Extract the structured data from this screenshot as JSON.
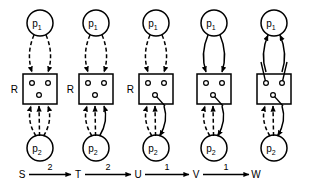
{
  "figure": {
    "type": "state-transition-diagram",
    "width": 316,
    "height": 193,
    "background_color": "#ffffff",
    "stroke_color": "#000000"
  },
  "labels": {
    "process_top": "p",
    "process_top_sub": "1",
    "process_bottom": "p",
    "process_bottom_sub": "2",
    "resource": "R"
  },
  "columns": [
    {
      "id": "S",
      "state_label": "S",
      "resource_label": "R",
      "top_label": "p",
      "top_sub": "1",
      "bottom_label": "p",
      "bottom_sub": "2",
      "cx": 40,
      "has_resource_label": true,
      "slot_links": [],
      "top_edges": [
        {
          "dir": "down",
          "style": "dashed"
        },
        {
          "dir": "down",
          "style": "dashed"
        }
      ],
      "bottom_edges": [
        {
          "dir": "up",
          "style": "dashed"
        },
        {
          "dir": "up",
          "style": "dashed"
        },
        {
          "dir": "up",
          "style": "dashed"
        }
      ]
    },
    {
      "id": "T",
      "state_label": "T",
      "resource_label": "R",
      "top_label": "p",
      "top_sub": "1",
      "bottom_label": "p",
      "bottom_sub": "2",
      "cx": 96,
      "has_resource_label": true,
      "slot_links": [],
      "top_edges": [
        {
          "dir": "down",
          "style": "dashed"
        },
        {
          "dir": "down",
          "style": "dashed"
        }
      ],
      "bottom_edges": [
        {
          "dir": "up",
          "style": "dashed"
        },
        {
          "dir": "up",
          "style": "dashed"
        },
        {
          "dir": "up",
          "style": "solid"
        }
      ]
    },
    {
      "id": "U",
      "state_label": "U",
      "resource_label": "R",
      "top_label": "p",
      "top_sub": "1",
      "bottom_label": "p",
      "bottom_sub": "2",
      "cx": 156,
      "has_resource_label": true,
      "slot_links": [
        "bottom"
      ],
      "top_edges": [
        {
          "dir": "down",
          "style": "dashed"
        },
        {
          "dir": "down",
          "style": "dashed"
        }
      ],
      "bottom_edges": [
        {
          "dir": "up",
          "style": "dashed"
        },
        {
          "dir": "up",
          "style": "dashed"
        },
        {
          "dir": "down",
          "style": "solid"
        }
      ]
    },
    {
      "id": "V",
      "state_label": "V",
      "resource_label": "",
      "top_label": "p",
      "top_sub": "1",
      "bottom_label": "p",
      "bottom_sub": "2",
      "cx": 214,
      "has_resource_label": false,
      "slot_links": [
        "bottom"
      ],
      "top_edges": [
        {
          "dir": "down",
          "style": "solid"
        },
        {
          "dir": "down",
          "style": "solid"
        }
      ],
      "bottom_edges": [
        {
          "dir": "up",
          "style": "dashed"
        },
        {
          "dir": "up",
          "style": "dashed"
        },
        {
          "dir": "down",
          "style": "solid"
        }
      ]
    },
    {
      "id": "W",
      "state_label": "W",
      "resource_label": "",
      "top_label": "p",
      "top_sub": "1",
      "bottom_label": "p",
      "bottom_sub": "2",
      "cx": 274,
      "has_resource_label": false,
      "slot_links": [
        "bottom",
        "top-left",
        "top-right"
      ],
      "top_edges": [
        {
          "dir": "up",
          "style": "solid"
        },
        {
          "dir": "up",
          "style": "solid"
        }
      ],
      "bottom_edges": [
        {
          "dir": "up",
          "style": "dashed"
        },
        {
          "dir": "up",
          "style": "dashed"
        },
        {
          "dir": "down",
          "style": "solid"
        }
      ]
    }
  ],
  "timeline": {
    "states": [
      "S",
      "T",
      "U",
      "V",
      "W"
    ],
    "transitions": [
      {
        "from": "S",
        "to": "T",
        "label": "2"
      },
      {
        "from": "T",
        "to": "U",
        "label": "2"
      },
      {
        "from": "U",
        "to": "V",
        "label": "1"
      },
      {
        "from": "V",
        "to": "W",
        "label": "1"
      }
    ]
  }
}
